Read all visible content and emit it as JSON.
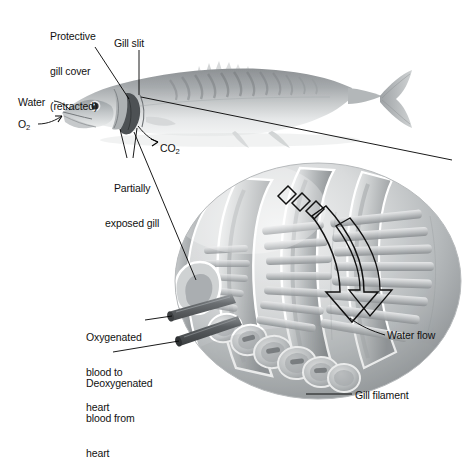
{
  "figure": {
    "background_color": "#ffffff",
    "ink_color": "#111111",
    "line_color": "#000000"
  },
  "labels": {
    "protective_gill_cover": "Protective\ngill cover\n(retracted)",
    "protective_gill_cover_line1": "Protective",
    "protective_gill_cover_line2": "gill cover",
    "protective_gill_cover_line3": "(retracted)",
    "gill_slit": "Gill slit",
    "water": "Water",
    "oxygen": "O",
    "oxygen_sub": "2",
    "carbon_dioxide": "CO",
    "carbon_dioxide_sub": "2",
    "partially_exposed_gill_line1": "Partially",
    "partially_exposed_gill_line2": "exposed gill",
    "oxygenated_blood_line1": "Oxygenated",
    "oxygenated_blood_line2": "blood to",
    "oxygenated_blood_line3": "heart",
    "deoxygenated_blood_line1": "Deoxygenated",
    "deoxygenated_blood_line2": "blood from",
    "deoxygenated_blood_line3": "heart",
    "water_flow": "Water flow",
    "gill_filament": "Gill filament"
  },
  "anatomy": {
    "fish": {
      "name": "mackerel-illustration",
      "body_tone": "#b9bcbe",
      "dark_tone": "#6f7477",
      "highlight_tone": "#e8eaeb"
    },
    "gill_basket": {
      "name": "gill-arch-assembly",
      "arch_count": 4,
      "filament_rows": 6,
      "tone_light": "#e3e5e6",
      "tone_mid": "#b5b8ba",
      "tone_dark": "#84888b"
    },
    "blood_vessels": [
      {
        "name": "efferent-vessel",
        "label_key": "oxygenated_blood_line1",
        "tone": "#6c7073"
      },
      {
        "name": "afferent-vessel",
        "label_key": "deoxygenated_blood_line1",
        "tone": "#595d60"
      }
    ],
    "water_flow_arrow": {
      "name": "water-flow-arrow",
      "style": "outlined-hollow",
      "direction": "downward-through-gill",
      "stroke": "#111111"
    }
  }
}
